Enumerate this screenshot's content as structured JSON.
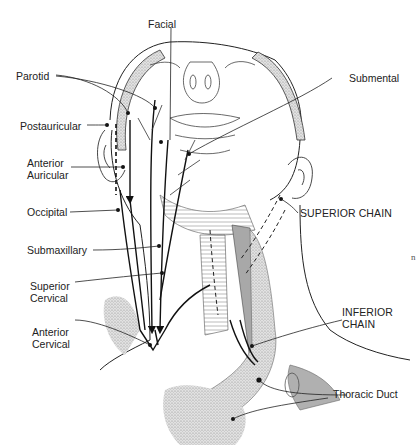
{
  "figure": {
    "labels": {
      "facial": "Facial",
      "parotid": "Parotid",
      "postauricular": "Postauricular",
      "anterior_auricular_1": "Anterior",
      "anterior_auricular_2": "Auricular",
      "occipital": "Occipital",
      "submaxillary": "Submaxillary",
      "superior_cervical_1": "Superior",
      "superior_cervical_2": "Cervical",
      "anterior_cervical_1": "Anterior",
      "anterior_cervical_2": "Cervical",
      "submental": "Submental",
      "superior_chain": "SUPERIOR CHAIN",
      "inferior_chain_1": "INFERIOR",
      "inferior_chain_2": "CHAIN",
      "thoracic_duct": "Thoracic Duct",
      "stray_mark": "n"
    },
    "colors": {
      "line": "#1a1a1a",
      "stipple": "#bdbdbd",
      "muscle_gray": "#a8a8a8",
      "background": "#ffffff"
    }
  }
}
